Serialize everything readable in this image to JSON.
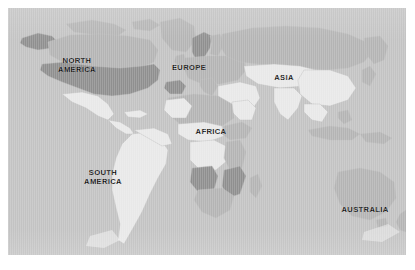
{
  "figure": {
    "kind": "world-map",
    "projection_note": "equirectangular world map",
    "background_color": "#ffffff",
    "ocean_color": "#c3c3c3",
    "border_color": "#b0b0b0"
  },
  "legend_shades": {
    "dark": "#8f8f8f",
    "medium": "#b4b4b4",
    "light": "#e8e8e8",
    "lightest": "#f2f2f2"
  },
  "labels": [
    {
      "id": "north-america",
      "text": "NORTH\nAMERICA",
      "x": 69,
      "y": 58
    },
    {
      "id": "europe",
      "text": "EUROPE",
      "x": 181,
      "y": 60
    },
    {
      "id": "asia",
      "text": "ASIA",
      "x": 276,
      "y": 70
    },
    {
      "id": "africa",
      "text": "AFRICA",
      "x": 203,
      "y": 124
    },
    {
      "id": "south-america",
      "text": "SOUTH\nAMERICA",
      "x": 95,
      "y": 170
    },
    {
      "id": "australia",
      "text": "AUSTRALIA",
      "x": 357,
      "y": 202
    }
  ],
  "regions": [
    {
      "id": "usa",
      "name": "United States",
      "shade": "dark"
    },
    {
      "id": "alaska",
      "name": "Alaska",
      "shade": "dark"
    },
    {
      "id": "canada",
      "name": "Canada",
      "shade": "medium"
    },
    {
      "id": "greenland",
      "name": "Greenland",
      "shade": "medium"
    },
    {
      "id": "mexico",
      "name": "Mexico",
      "shade": "light"
    },
    {
      "id": "central-america",
      "name": "Central America",
      "shade": "light"
    },
    {
      "id": "south-america",
      "name": "South America",
      "shade": "light"
    },
    {
      "id": "scandinavia",
      "name": "Scandinavia",
      "shade": "dark"
    },
    {
      "id": "iberia",
      "name": "Iberia",
      "shade": "dark"
    },
    {
      "id": "europe",
      "name": "Europe",
      "shade": "medium"
    },
    {
      "id": "russia",
      "name": "Russia",
      "shade": "medium"
    },
    {
      "id": "china-india",
      "name": "Asia (south)",
      "shade": "light"
    },
    {
      "id": "middle-east",
      "name": "Middle East",
      "shade": "light"
    },
    {
      "id": "north-africa",
      "name": "North Africa",
      "shade": "medium"
    },
    {
      "id": "angola",
      "name": "Angola",
      "shade": "dark"
    },
    {
      "id": "mozambique",
      "name": "Mozambique",
      "shade": "dark"
    },
    {
      "id": "congo",
      "name": "Congo",
      "shade": "light"
    },
    {
      "id": "sahara-west",
      "name": "West Sahara",
      "shade": "light"
    },
    {
      "id": "australia",
      "name": "Australia",
      "shade": "medium"
    },
    {
      "id": "antarctica-rim",
      "name": "Southern rim",
      "shade": "lightest"
    }
  ]
}
